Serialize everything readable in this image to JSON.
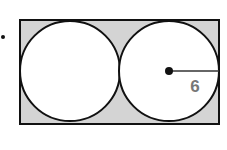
{
  "figure": {
    "bullet": "•",
    "radius_label": "6",
    "shape": "rectangle with two inscribed tangent circles",
    "colors": {
      "shaded_region": "#d4d4d4",
      "stroke": "#111111",
      "label": "#777777",
      "background": "#ffffff"
    }
  }
}
